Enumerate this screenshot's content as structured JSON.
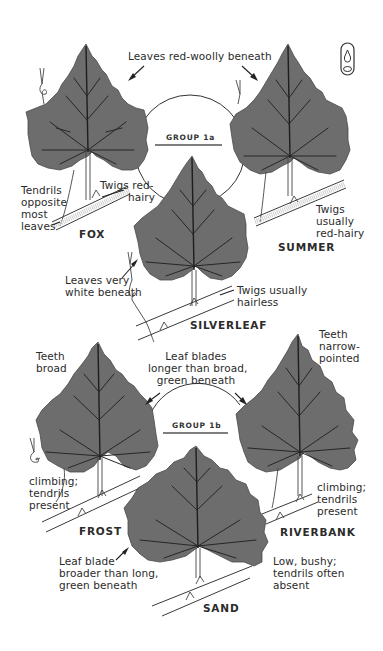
{
  "page": {
    "icon": "habitat-glyph-icon"
  },
  "group1a": {
    "label": "GROUP 1a",
    "shared_note": "Leaves red-woolly beneath",
    "species": [
      {
        "name": "FOX",
        "notes": [
          "Tendrils",
          "opposite",
          "most",
          "leaves"
        ],
        "twig_note": [
          "Twigs red-",
          "hairy"
        ]
      },
      {
        "name": "SUMMER",
        "twig_note": [
          "Twigs",
          "usually",
          "red-hairy"
        ]
      },
      {
        "name": "SILVERLEAF",
        "notes": [
          "Leaves very",
          "white beneath"
        ],
        "twig_note": [
          "Twigs usually",
          "hairless"
        ]
      }
    ]
  },
  "group1b": {
    "label": "GROUP 1b",
    "shared_note": [
      "Leaf blades",
      "longer than broad,",
      "green beneath"
    ],
    "species": [
      {
        "name": "FROST",
        "teeth_note": [
          "Teeth",
          "broad"
        ],
        "habit_note": [
          "climbing;",
          "tendrils",
          "present"
        ]
      },
      {
        "name": "RIVERBANK",
        "teeth_note": [
          "Teeth",
          "narrow-",
          "pointed"
        ],
        "habit_note": [
          "climbing;",
          "tendrils",
          "present"
        ]
      },
      {
        "name": "SAND",
        "blade_note": [
          "Leaf blade",
          "broader than long,",
          "green beneath"
        ],
        "habit_note": [
          "Low, bushy;",
          "tendrils often",
          "absent"
        ]
      }
    ]
  },
  "colors": {
    "leaf_fill": "#6d6d6d",
    "vein": "#262626",
    "background": "#ffffff",
    "text": "#2b2b2b"
  }
}
